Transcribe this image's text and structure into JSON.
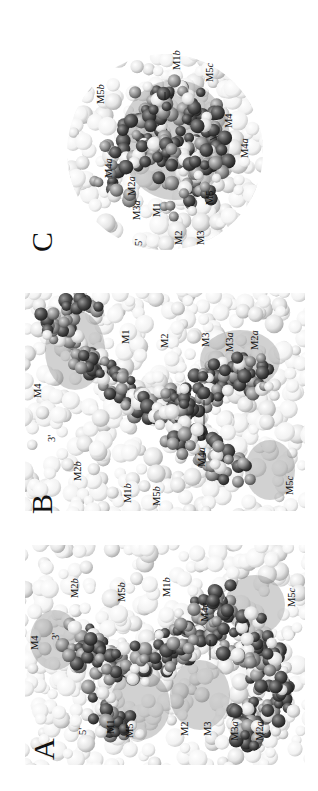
{
  "figure": {
    "orientation": "rotated-90-ccw",
    "panels": [
      {
        "id": "C",
        "letter": "C",
        "shape": "circular-surface-view",
        "labels": [
          {
            "base": "M1",
            "suffix": "b"
          },
          {
            "base": "M5",
            "suffix": "c"
          },
          {
            "base": "M5",
            "suffix": "b"
          },
          {
            "base": "M4",
            "suffix": ""
          },
          {
            "base": "M4",
            "suffix": "a"
          },
          {
            "base": "M4",
            "suffix": "a"
          },
          {
            "base": "M2",
            "suffix": "a"
          },
          {
            "base": "M3",
            "suffix": "a"
          },
          {
            "base": "M5",
            "suffix": ""
          },
          {
            "base": "M1",
            "suffix": ""
          },
          {
            "base": "M2",
            "suffix": ""
          },
          {
            "base": "M3",
            "suffix": ""
          },
          {
            "base": "5'",
            "suffix": ""
          }
        ]
      },
      {
        "id": "B",
        "letter": "B",
        "shape": "rectangular-surface-view",
        "labels": [
          {
            "base": "M4",
            "suffix": ""
          },
          {
            "base": "3'",
            "suffix": ""
          },
          {
            "base": "M2",
            "suffix": "b"
          },
          {
            "base": "M1",
            "suffix": "b"
          },
          {
            "base": "M5",
            "suffix": "b"
          },
          {
            "base": "M1",
            "suffix": ""
          },
          {
            "base": "M2",
            "suffix": ""
          },
          {
            "base": "M3",
            "suffix": ""
          },
          {
            "base": "M3",
            "suffix": "a"
          },
          {
            "base": "M2",
            "suffix": "a"
          },
          {
            "base": "M4",
            "suffix": "a"
          },
          {
            "base": "M5",
            "suffix": "c"
          }
        ]
      },
      {
        "id": "A",
        "letter": "A",
        "shape": "rectangular-surface-view",
        "labels": [
          {
            "base": "M4",
            "suffix": ""
          },
          {
            "base": "3'",
            "suffix": ""
          },
          {
            "base": "M2",
            "suffix": "b"
          },
          {
            "base": "M5",
            "suffix": "b"
          },
          {
            "base": "M1",
            "suffix": "b"
          },
          {
            "base": "M4",
            "suffix": "c"
          },
          {
            "base": "M5",
            "suffix": "c"
          },
          {
            "base": "5'",
            "suffix": ""
          },
          {
            "base": "M1",
            "suffix": ""
          },
          {
            "base": "M5",
            "suffix": ""
          },
          {
            "base": "M2",
            "suffix": ""
          },
          {
            "base": "M3",
            "suffix": ""
          },
          {
            "base": "M3",
            "suffix": "a"
          },
          {
            "base": "M2",
            "suffix": "a"
          }
        ]
      }
    ]
  }
}
